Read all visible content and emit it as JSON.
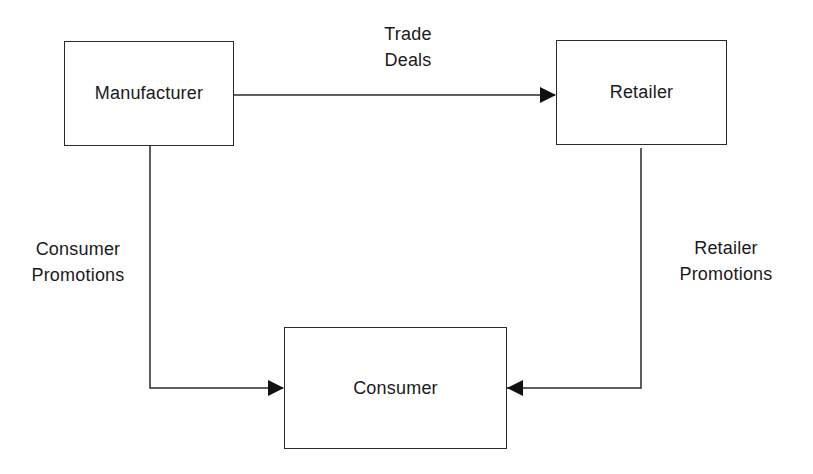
{
  "diagram": {
    "type": "flow",
    "nodes": [
      {
        "id": "manufacturer",
        "label": "Manufacturer"
      },
      {
        "id": "retailer",
        "label": "Retailer"
      },
      {
        "id": "consumer",
        "label": "Consumer"
      }
    ],
    "edges": [
      {
        "from": "manufacturer",
        "to": "retailer",
        "label_lines": [
          "Trade",
          "Deals"
        ]
      },
      {
        "from": "manufacturer",
        "to": "consumer",
        "label_lines": [
          "Consumer",
          "Promotions"
        ]
      },
      {
        "from": "retailer",
        "to": "consumer",
        "label_lines": [
          "Retailer",
          "Promotions"
        ]
      }
    ],
    "colors": {
      "line": "#2a2a2a",
      "background": "#ffffff",
      "text": "#1a1a1a"
    }
  }
}
